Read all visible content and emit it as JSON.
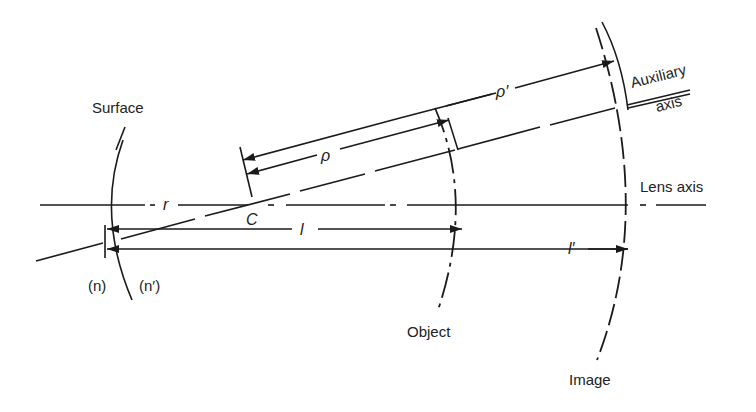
{
  "diagram": {
    "labels": {
      "surface": "Surface",
      "auxiliary_axis_line1": "Auxiliary",
      "auxiliary_axis_line2": "axis",
      "lens_axis": "Lens axis",
      "object": "Object",
      "image": "Image",
      "n": "(n)",
      "n_prime": "(n′)"
    },
    "symbols": {
      "radius": "r",
      "center": "C",
      "object_distance": "l",
      "image_distance": "l′",
      "rho": "ρ",
      "rho_prime": "ρ′"
    },
    "colors": {
      "line": "#1a1a1a",
      "text": "#222222",
      "background": "#ffffff"
    }
  }
}
